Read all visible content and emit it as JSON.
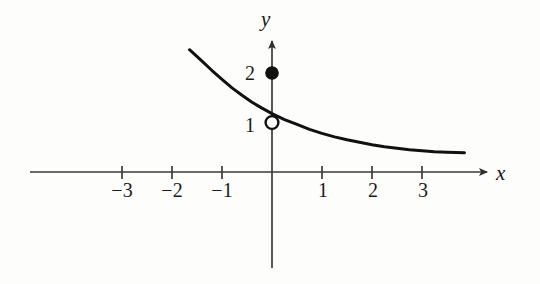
{
  "figure": {
    "type": "graph",
    "background_color": "#fdfdfc",
    "curve_color": "#111111",
    "axis_color": "#3a3a3a"
  },
  "axes": {
    "x_label": "x",
    "y_label": "y",
    "x_ticks": [
      {
        "label": "−3",
        "value": -3
      },
      {
        "label": "−2",
        "value": -2
      },
      {
        "label": "−1",
        "value": -1
      },
      {
        "label": "1",
        "value": 1
      },
      {
        "label": "2",
        "value": 2
      },
      {
        "label": "3",
        "value": 3
      }
    ],
    "y_ticks": [
      {
        "label": "1",
        "value": 1
      },
      {
        "label": "2",
        "value": 2
      }
    ]
  },
  "chart_data": {
    "type": "line",
    "title": "",
    "subtitle": "",
    "xlabel": "x",
    "ylabel": "y",
    "xlim": [
      -4.85,
      4.35
    ],
    "ylim": [
      -1.95,
      2.7
    ],
    "grid": false,
    "legend": null,
    "series": [
      {
        "name": "exponential-decay-curve",
        "type": "line",
        "style": "solid",
        "color": "#111111",
        "width": 3,
        "x": [
          -1.65,
          -1.4,
          -1.2,
          -1.0,
          -0.8,
          -0.6,
          -0.4,
          -0.2,
          0.0,
          0.25,
          0.5,
          0.75,
          1.0,
          1.25,
          1.5,
          1.75,
          2.0,
          2.25,
          2.5,
          2.75,
          3.0,
          3.25,
          3.5,
          3.85
        ],
        "y": [
          2.47,
          2.24,
          2.05,
          1.87,
          1.7,
          1.55,
          1.41,
          1.29,
          1.18,
          1.06,
          0.96,
          0.86,
          0.78,
          0.71,
          0.65,
          0.6,
          0.55,
          0.51,
          0.48,
          0.45,
          0.43,
          0.41,
          0.4,
          0.39
        ]
      }
    ],
    "points": [
      {
        "name": "open-point-hole",
        "marker": "open-circle",
        "x": 0,
        "y": 1,
        "label": "1",
        "fill": "#ffffff",
        "stroke": "#111111"
      },
      {
        "name": "filled-point-value",
        "marker": "filled-circle",
        "x": 0,
        "y": 2,
        "label": "2",
        "fill": "#111111",
        "stroke": "#111111"
      }
    ],
    "annotations": []
  }
}
